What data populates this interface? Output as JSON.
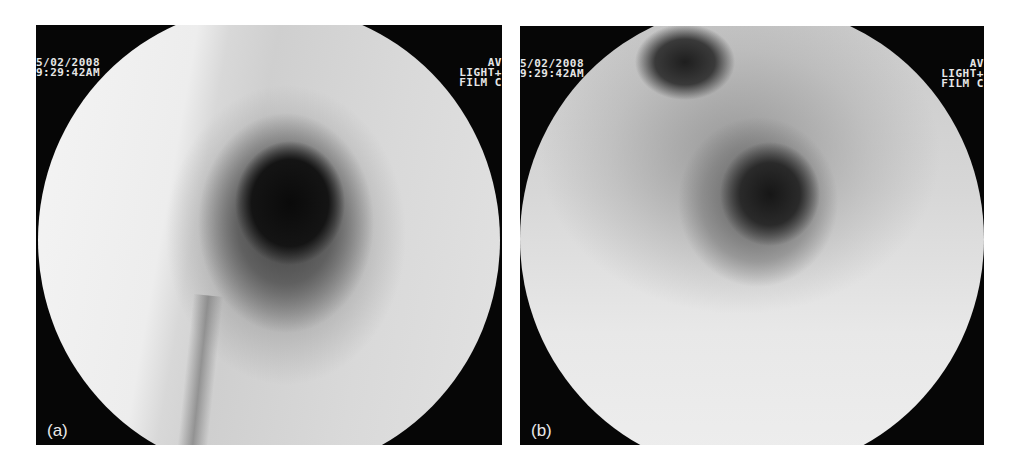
{
  "figure": {
    "panels": [
      {
        "label": "(a)",
        "osd_left": {
          "date": "5/02/2008",
          "time": "9:29:42AM"
        },
        "osd_right": {
          "line1": "AV",
          "line2": "LIGHT+",
          "line3": "FILM C"
        },
        "description": "Endoscopic view of tubular lumen with concentric rings and dark central opening"
      },
      {
        "label": "(b)",
        "osd_left": {
          "date": "5/02/2008",
          "time": "9:29:42AM"
        },
        "osd_right": {
          "line1": "AV",
          "line2": "LIGHT+",
          "line3": "FILM C"
        },
        "description": "Endoscopic view showing bifurcation with two openings, a smaller dark one upper left and a larger central lumen"
      }
    ]
  }
}
